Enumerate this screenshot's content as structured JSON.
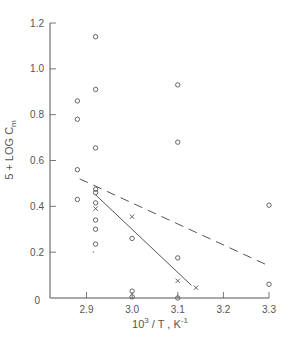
{
  "chart_data": {
    "type": "scatter",
    "title": "",
    "xlabel": "10^3 / T,  K^-1",
    "xlabel_parts": {
      "base": "10",
      "sup": "3",
      "mid": " / T ,   K",
      "sup2": "-1"
    },
    "ylabel": "5 + LOG C_m",
    "ylabel_parts": {
      "main": "5 + LOG C",
      "sub": "m"
    },
    "xlim": [
      2.82,
      3.3
    ],
    "ylim": [
      0,
      1.2
    ],
    "xticks": [
      2.9,
      3.0,
      3.1,
      3.2,
      3.3
    ],
    "xtick_labels": [
      "2.9",
      "3.0",
      "3.1",
      "3.2",
      "3.3"
    ],
    "yticks": [
      0,
      0.2,
      0.4,
      0.6,
      0.8,
      1.0,
      1.2
    ],
    "ytick_labels": [
      "0",
      "0.2",
      "0.4",
      "0.6",
      "0.8",
      "1.0",
      "1.2"
    ],
    "grid": false,
    "series": [
      {
        "name": "circles",
        "marker": "circle",
        "points": [
          [
            2.88,
            0.86
          ],
          [
            2.88,
            0.78
          ],
          [
            2.88,
            0.56
          ],
          [
            2.88,
            0.43
          ],
          [
            2.92,
            1.14
          ],
          [
            2.92,
            0.91
          ],
          [
            2.92,
            0.655
          ],
          [
            2.92,
            0.475
          ],
          [
            2.92,
            0.46
          ],
          [
            2.92,
            0.415
          ],
          [
            2.92,
            0.34
          ],
          [
            2.92,
            0.3
          ],
          [
            2.92,
            0.235
          ],
          [
            3.0,
            0.26
          ],
          [
            3.0,
            0.03
          ],
          [
            3.0,
            0.005
          ],
          [
            3.1,
            0.93
          ],
          [
            3.1,
            0.68
          ],
          [
            3.1,
            0.175
          ],
          [
            3.1,
            0.0
          ],
          [
            3.3,
            0.405
          ],
          [
            3.3,
            0.06
          ]
        ]
      },
      {
        "name": "crosses",
        "marker": "x",
        "points": [
          [
            2.92,
            0.39
          ],
          [
            3.0,
            0.355
          ],
          [
            3.1,
            0.075
          ],
          [
            3.14,
            0.045
          ]
        ]
      },
      {
        "name": "dot",
        "marker": "dot",
        "points": [
          [
            2.915,
            0.2
          ]
        ]
      }
    ],
    "lines": [
      {
        "name": "dashed-fit",
        "style": "dashed",
        "points": [
          [
            2.885,
            0.52
          ],
          [
            3.3,
            0.14
          ]
        ]
      },
      {
        "name": "solid-fit",
        "style": "solid",
        "points": [
          [
            2.92,
            0.45
          ],
          [
            3.13,
            0.055
          ]
        ]
      }
    ]
  },
  "colors": {
    "ink": "#555555",
    "background": "#ffffff"
  }
}
